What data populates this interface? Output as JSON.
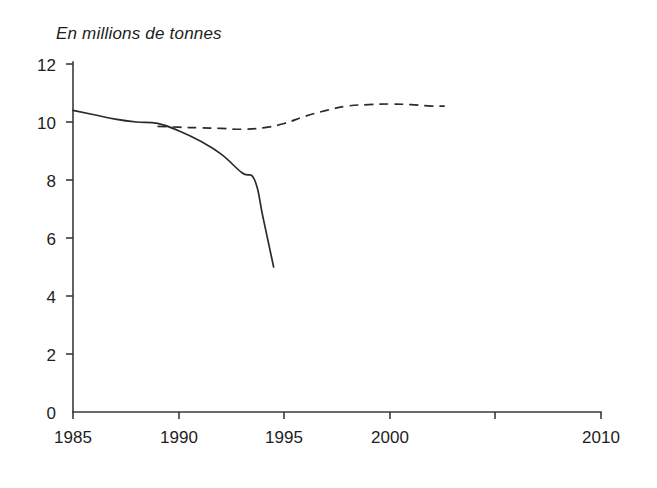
{
  "chart_data": {
    "type": "line",
    "title": "En millions de tonnes",
    "xlabel": "",
    "ylabel": "En millions de tonnes",
    "xlim": [
      1985,
      2010
    ],
    "ylim": [
      0,
      12
    ],
    "grid": false,
    "legend": "none",
    "x_ticks": [
      "1985",
      "1990",
      "1995",
      "2000",
      "2010"
    ],
    "x_tick_values": [
      1985,
      1990,
      1995,
      2000,
      2010
    ],
    "x_minor_tick_values": [
      2005
    ],
    "y_ticks": [
      "0",
      "2",
      "4",
      "6",
      "8",
      "10",
      "12"
    ],
    "y_tick_values": [
      0,
      2,
      4,
      6,
      8,
      10,
      12
    ],
    "series": [
      {
        "name": "serie-pleine",
        "style": "solid",
        "color": "#2b2b2b",
        "x": [
          1985,
          1986,
          1987,
          1988,
          1989,
          1990,
          1991,
          1992,
          1993,
          1993.6,
          1994,
          1994.5
        ],
        "values": [
          10.4,
          10.25,
          10.1,
          10.0,
          9.95,
          9.7,
          9.35,
          8.9,
          8.25,
          8.0,
          6.7,
          5.0
        ]
      },
      {
        "name": "serie-pointillee",
        "style": "dashed",
        "color": "#2b2b2b",
        "x": [
          1989,
          1990,
          1991,
          1992,
          1993,
          1994,
          1995,
          1996,
          1997,
          1998,
          1999,
          2000,
          2001,
          2002,
          2002.6
        ],
        "values": [
          9.85,
          9.82,
          9.8,
          9.78,
          9.75,
          9.8,
          9.95,
          10.2,
          10.4,
          10.55,
          10.6,
          10.62,
          10.6,
          10.55,
          10.55
        ]
      }
    ]
  },
  "axes": {
    "y_axis_label_top": "12",
    "y_axis_label_bottom": "0"
  }
}
